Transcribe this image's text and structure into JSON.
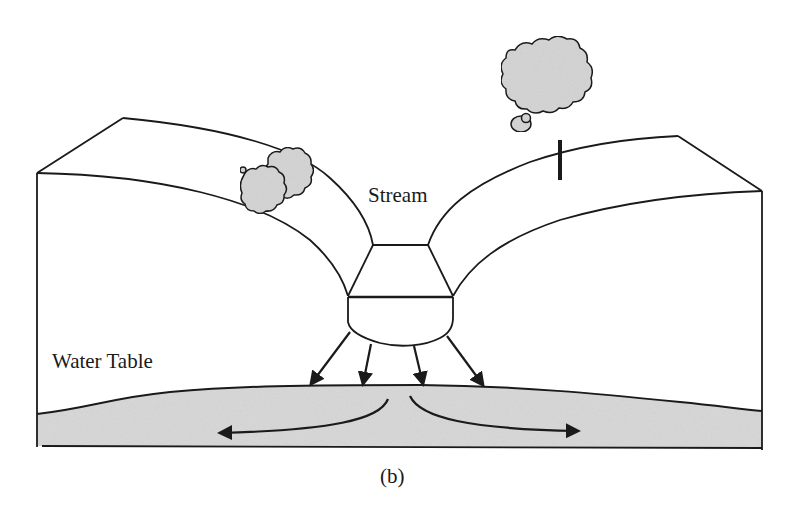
{
  "figure": {
    "panel_label": "(b)",
    "labels": {
      "stream": "Stream",
      "water_table": "Water Table"
    },
    "colors": {
      "line": "#1a1a1a",
      "groundwater_fill": "#d9d9d9",
      "foliage_fill": "#d6d6d6",
      "background": "#ffffff"
    },
    "elements": {
      "trees": [
        "small-shrub-left-bank",
        "tree-right-bank"
      ],
      "infiltration_arrows": 4,
      "lateral_flow_arrows": [
        "left",
        "right"
      ]
    }
  }
}
